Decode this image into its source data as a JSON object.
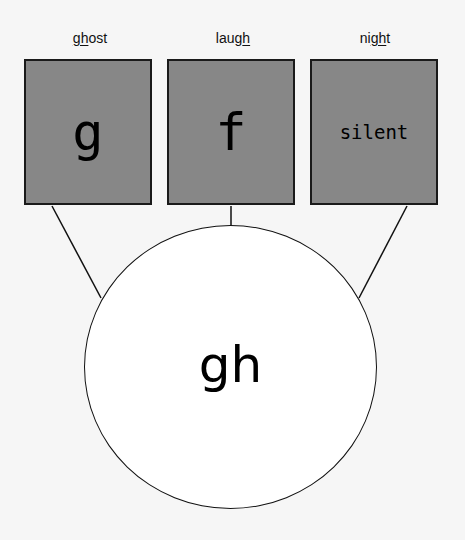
{
  "words": [
    {
      "before": "",
      "underlined": "gh",
      "after": "ost",
      "full": "ghost"
    },
    {
      "before": "laug",
      "underlined": "h",
      "after": "",
      "full": "laugh"
    },
    {
      "before": "ni",
      "underlined": "gh",
      "after": "t",
      "full": "night"
    }
  ],
  "sounds": [
    "g",
    "f",
    "silent"
  ],
  "center_label": "gh",
  "colors": {
    "box_fill": "#878787",
    "border": "#1a1a1a",
    "background": "#f6f6f6",
    "circle_fill": "#ffffff"
  }
}
